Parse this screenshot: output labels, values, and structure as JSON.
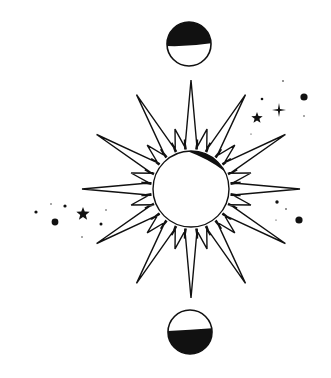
{
  "illustration": {
    "title": "Celestial sun with moon phases",
    "colors": {
      "ink": "#111111",
      "background": "#ffffff"
    },
    "sun": {
      "center": [
        191,
        189
      ],
      "core_radius": 38,
      "long_ray_length": 109,
      "short_ray_length": 62,
      "long_ray_count": 12,
      "short_ray_count": 12,
      "ray_half_width_deg": 5.5,
      "shadow": "crescent-upper-right"
    },
    "moons": [
      {
        "position": "top",
        "center": [
          189,
          44
        ],
        "radius": 22,
        "shaded": "upper-half"
      },
      {
        "position": "bottom",
        "center": [
          190,
          332
        ],
        "radius": 22,
        "shaded": "lower-half"
      }
    ],
    "stars": [
      {
        "type": "five-point",
        "x": 257,
        "y": 118,
        "size": 6
      },
      {
        "type": "sparkle",
        "x": 279,
        "y": 110,
        "size": 7
      },
      {
        "type": "five-point",
        "x": 83,
        "y": 214,
        "size": 7
      }
    ],
    "dots": [
      {
        "x": 304,
        "y": 97,
        "r": 3.6
      },
      {
        "x": 262,
        "y": 99,
        "r": 1.3
      },
      {
        "x": 283,
        "y": 81,
        "r": 0.8
      },
      {
        "x": 304,
        "y": 116,
        "r": 0.7
      },
      {
        "x": 251,
        "y": 134,
        "r": 0.6
      },
      {
        "x": 55,
        "y": 222,
        "r": 3.4
      },
      {
        "x": 36,
        "y": 212,
        "r": 1.6
      },
      {
        "x": 65,
        "y": 206,
        "r": 1.6
      },
      {
        "x": 101,
        "y": 224,
        "r": 1.5
      },
      {
        "x": 51,
        "y": 204,
        "r": 0.7
      },
      {
        "x": 106,
        "y": 210,
        "r": 0.7
      },
      {
        "x": 82,
        "y": 237,
        "r": 0.7
      },
      {
        "x": 277,
        "y": 202,
        "r": 1.7
      },
      {
        "x": 299,
        "y": 220,
        "r": 3.6
      },
      {
        "x": 286,
        "y": 209,
        "r": 0.8
      },
      {
        "x": 276,
        "y": 220,
        "r": 0.6
      }
    ]
  }
}
